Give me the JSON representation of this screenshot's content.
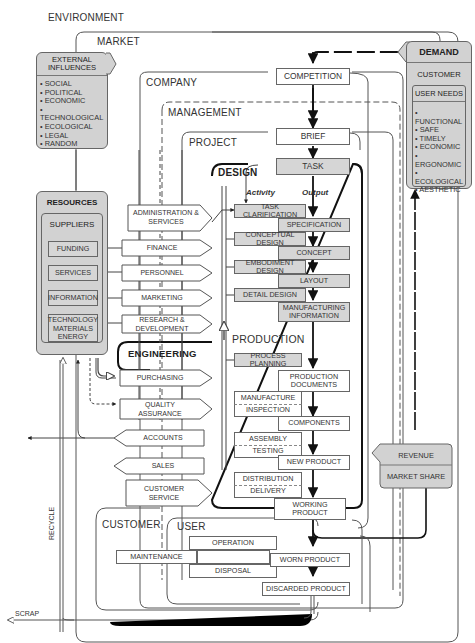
{
  "levels": {
    "environment": "ENVIRONMENT",
    "market": "MARKET",
    "company": "COMPANY",
    "management": "MANAGEMENT",
    "project": "PROJECT",
    "design": "DESIGN",
    "production": "PRODUCTION",
    "engineering": "ENGINEERING",
    "customer": "CUSTOMER",
    "user": "USER"
  },
  "external_influences": {
    "title": "EXTERNAL INFLUENCES",
    "items": [
      "SOCIAL",
      "POLITICAL",
      "ECONOMIC",
      "TECHNOLOGICAL",
      "ECOLOGICAL",
      "LEGAL",
      "RANDOM"
    ]
  },
  "demand": {
    "title": "DEMAND",
    "customer": "CUSTOMER",
    "user_needs": "USER NEEDS",
    "items": [
      "FUNCTIONAL",
      "SAFE",
      "TIMELY",
      "ECONOMIC",
      "ERGONOMIC",
      "ECOLOGICAL",
      "AESTHETIC"
    ]
  },
  "resources": {
    "title": "RESOURCES",
    "suppliers": "SUPPLIERS",
    "items": [
      "FUNDING",
      "SERVICES",
      "INFORMATION",
      "TECHNOLOGY",
      "MATERIALS ENERGY"
    ]
  },
  "flow": {
    "competition": "COMPETITION",
    "brief": "BRIEF",
    "task": "TASK",
    "activity": "Activity",
    "output": "Output"
  },
  "design_activities": [
    "TASK CLARIFICATION",
    "CONCEPTUAL DESIGN",
    "EMBODIMENT DESIGN",
    "DETAIL DESIGN"
  ],
  "design_outputs": [
    "SPECIFICATION",
    "CONCEPT",
    "LAYOUT",
    "MANUFACTURING INFORMATION"
  ],
  "production_activities": [
    "PROCESS PLANNING",
    "MANUFACTURE",
    "INSPECTION",
    "ASSEMBLY",
    "TESTING",
    "DISTRIBUTION",
    "DELIVERY"
  ],
  "production_outputs": [
    "PRODUCTION DOCUMENTS",
    "COMPONENTS",
    "NEW PRODUCT",
    "WORKING PRODUCT"
  ],
  "departments": [
    "ADMINISTRATION & SERVICES",
    "FINANCE",
    "PERSONNEL",
    "MARKETING",
    "RESEARCH & DEVELOPMENT",
    "PURCHASING",
    "QUALITY ASSURANCE",
    "ACCOUNTS",
    "SALES",
    "CUSTOMER SERVICE"
  ],
  "user_activities": [
    "OPERATION",
    "MAINTENANCE",
    "DISPOSAL"
  ],
  "user_outputs": [
    "WORN PRODUCT",
    "DISCARDED PRODUCT"
  ],
  "revenue": {
    "revenue": "REVENUE",
    "market_share": "MARKET SHARE"
  },
  "side_labels": {
    "recycle": "RECYCLE",
    "scrap": "SCRAP"
  }
}
